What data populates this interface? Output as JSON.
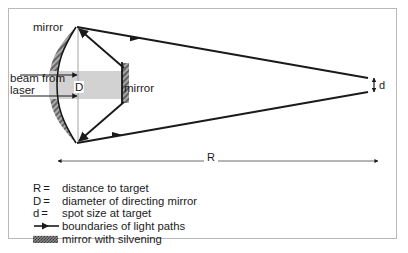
{
  "figure": {
    "labels": {
      "mirror_primary": "mirror",
      "mirror_directing": "mirror",
      "beam_source_line1": "beam from",
      "beam_source_line2": "laser",
      "diameter_symbol": "D",
      "spot_symbol": "d",
      "range_symbol": "R"
    }
  },
  "legend": {
    "rows": [
      {
        "key": "R",
        "eq": "=",
        "text": "distance to target",
        "key_type": "text"
      },
      {
        "key": "D",
        "eq": "=",
        "text": "diameter of directing mirror",
        "key_type": "text"
      },
      {
        "key": "d",
        "eq": "=",
        "text": "spot size at target",
        "key_type": "text"
      },
      {
        "key": "arrow-swatch",
        "eq": "",
        "text": "boundaries of light paths",
        "key_type": "arrow"
      },
      {
        "key": "mirror-swatch",
        "eq": "",
        "text": "mirror with silvening",
        "key_type": "hatch"
      }
    ]
  },
  "colors": {
    "ink": "#1a1a1a",
    "frame": "#b9b9b9",
    "beam_fill": "#d2d2d2",
    "silvering": "#8a8a8a",
    "centerline": "#9a9a9a",
    "background": "#ffffff"
  },
  "geometry": {
    "primary_mirror_top_vertex": [
      76,
      27
    ],
    "primary_mirror_bottom_vertex": [
      76,
      143
    ],
    "directing_mirror_x": 122,
    "target_x": 368,
    "spot_top_y": 78,
    "spot_bottom_y": 92,
    "range_arrow": [
      58,
      161,
      378,
      161
    ]
  }
}
